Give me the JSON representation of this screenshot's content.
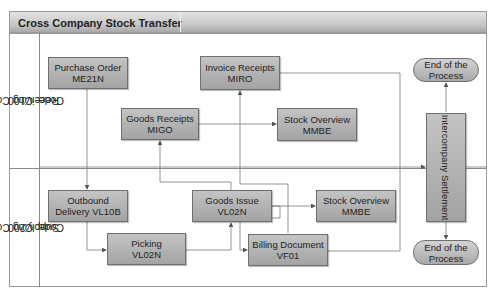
{
  "title": "Cross Company Stock Transfer",
  "lanes": [
    {
      "id": "receiving",
      "line1": "Receiving Company",
      "line2": "Code: C100"
    },
    {
      "id": "supplying",
      "line1": "Supplying Company",
      "line2": "Code: C200"
    }
  ],
  "nodes": {
    "purchase_order": {
      "line1": "Purchase Order",
      "line2": "ME21N"
    },
    "goods_receipts": {
      "line1": "Goods Receipts",
      "line2": "MIGO"
    },
    "invoice_receipts": {
      "line1": "Invoice Receipts",
      "line2": "MIRO"
    },
    "stock_overview_receiving": {
      "line1": "Stock Overview",
      "line2": "MMBE"
    },
    "end_top": {
      "line1": "End of the",
      "line2": "Process"
    },
    "intercompany": {
      "label": "Intercompany Settlement"
    },
    "outbound_delivery": {
      "line1": "Outbound",
      "line2": "Delivery VL10B"
    },
    "picking": {
      "line1": "Picking",
      "line2": "VL02N"
    },
    "goods_issue": {
      "line1": "Goods Issue",
      "line2": "VL02N"
    },
    "stock_overview_supplying": {
      "line1": "Stock Overview",
      "line2": "MMBE"
    },
    "billing_document": {
      "line1": "Billing Document",
      "line2": "VF01"
    },
    "end_bottom": {
      "line1": "End of the",
      "line2": "Process"
    }
  },
  "edges": [
    [
      "purchase_order",
      "outbound_delivery"
    ],
    [
      "outbound_delivery",
      "picking"
    ],
    [
      "picking",
      "goods_issue"
    ],
    [
      "goods_issue",
      "goods_receipts"
    ],
    [
      "goods_issue",
      "stock_overview_supplying"
    ],
    [
      "goods_issue",
      "billing_document"
    ],
    [
      "goods_receipts",
      "stock_overview_receiving"
    ],
    [
      "billing_document",
      "invoice_receipts"
    ],
    [
      "invoice_receipts",
      "intercompany"
    ],
    [
      "billing_document",
      "intercompany"
    ],
    [
      "intercompany",
      "end_top"
    ],
    [
      "intercompany",
      "end_bottom"
    ]
  ]
}
